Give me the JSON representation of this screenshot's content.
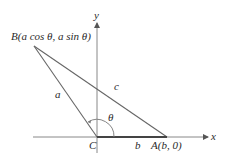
{
  "diagram": {
    "axes": {
      "x_label": "x",
      "y_label": "y"
    },
    "vertices": {
      "B": {
        "label": "B(a cos θ, a sin θ)",
        "name": "B",
        "coords": "(a cos θ, a sin θ)"
      },
      "A": {
        "label": "A(b, 0)",
        "name": "A",
        "coords": "(b, 0)"
      },
      "C": {
        "label": "C",
        "name": "C"
      }
    },
    "sides": {
      "a": "a",
      "b": "b",
      "c": "c"
    },
    "angle": {
      "label": "θ"
    },
    "colors": {
      "line": "#5a5a5a",
      "axis": "#777777",
      "text": "#2a2a2a"
    }
  }
}
